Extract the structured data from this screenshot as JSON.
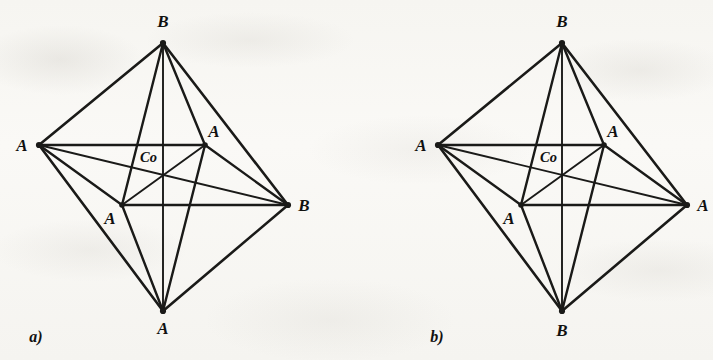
{
  "figure": {
    "background_color": "#f7f6f3",
    "ink_color": "#1a1a18",
    "center_atom": "Co"
  },
  "diagrams": [
    {
      "id": "diagram-a",
      "caption": "a)",
      "caption_x": 36,
      "caption_y": 342,
      "center_label": "Co",
      "center_label_x": 140,
      "center_label_y": 162,
      "nodes": {
        "top": {
          "label": "B",
          "x": 163,
          "y": 43,
          "lx": 163,
          "ly": 27
        },
        "bottom": {
          "label": "A",
          "x": 163,
          "y": 311,
          "lx": 163,
          "ly": 334
        },
        "left": {
          "label": "A",
          "x": 39,
          "y": 145,
          "lx": 22,
          "ly": 151
        },
        "right": {
          "label": "B",
          "x": 288,
          "y": 205,
          "lx": 304,
          "ly": 211
        },
        "inner_upper": {
          "label": "A",
          "x": 205,
          "y": 145,
          "lx": 214,
          "ly": 137
        },
        "inner_lower": {
          "label": "A",
          "x": 122,
          "y": 205,
          "lx": 110,
          "ly": 224
        },
        "center": {
          "label": "Co",
          "x": 163,
          "y": 175
        }
      }
    },
    {
      "id": "diagram-b",
      "caption": "b)",
      "caption_x": 437,
      "caption_y": 342,
      "center_label": "Co",
      "center_label_x": 540,
      "center_label_y": 162,
      "nodes": {
        "top": {
          "label": "B",
          "x": 562,
          "y": 43,
          "lx": 562,
          "ly": 27
        },
        "bottom": {
          "label": "B",
          "x": 562,
          "y": 311,
          "lx": 562,
          "ly": 336
        },
        "left": {
          "label": "A",
          "x": 438,
          "y": 145,
          "lx": 421,
          "ly": 151
        },
        "right": {
          "label": "A",
          "x": 687,
          "y": 205,
          "lx": 703,
          "ly": 211
        },
        "inner_upper": {
          "label": "A",
          "x": 604,
          "y": 145,
          "lx": 613,
          "ly": 137
        },
        "inner_lower": {
          "label": "A",
          "x": 521,
          "y": 205,
          "lx": 509,
          "ly": 224
        },
        "center": {
          "label": "Co",
          "x": 562,
          "y": 175
        }
      }
    }
  ],
  "chart_data": {
    "type": "diagram",
    "subtype": "octahedral-coordination-isomers",
    "title": "",
    "structures": [
      {
        "name": "a)",
        "central_atom": "Co",
        "vertices": [
          {
            "position": "top",
            "ligand": "B"
          },
          {
            "position": "left",
            "ligand": "A"
          },
          {
            "position": "right",
            "ligand": "B"
          },
          {
            "position": "bottom",
            "ligand": "A"
          },
          {
            "position": "inner-upper-right",
            "ligand": "A"
          },
          {
            "position": "inner-lower-left",
            "ligand": "A"
          }
        ],
        "formula": "CoA4B2",
        "isomer": "cis"
      },
      {
        "name": "b)",
        "central_atom": "Co",
        "vertices": [
          {
            "position": "top",
            "ligand": "B"
          },
          {
            "position": "left",
            "ligand": "A"
          },
          {
            "position": "right",
            "ligand": "A"
          },
          {
            "position": "bottom",
            "ligand": "B"
          },
          {
            "position": "inner-upper-right",
            "ligand": "A"
          },
          {
            "position": "inner-lower-left",
            "ligand": "A"
          }
        ],
        "formula": "CoA4B2",
        "isomer": "trans"
      }
    ]
  }
}
